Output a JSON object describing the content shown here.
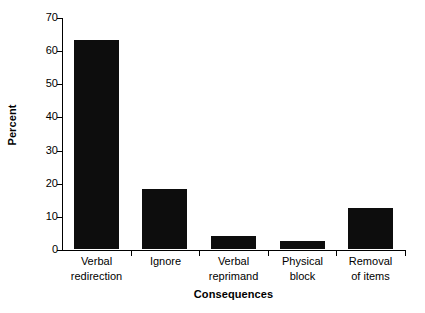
{
  "chart_data": {
    "type": "bar",
    "title": "",
    "subtitle": "",
    "xlabel": "Consequences",
    "ylabel": "Percent",
    "categories": [
      "Verbal\nredirection",
      "Ignore",
      "Verbal\nreprimand",
      "Physical\nblock",
      "Removal\nof items"
    ],
    "values": [
      63,
      18,
      4,
      2.3,
      12.3
    ],
    "ylim": [
      0,
      70
    ],
    "yticks": [
      0,
      10,
      20,
      30,
      40,
      50,
      60,
      70
    ],
    "ytick_labels": [
      "0",
      "10",
      "20",
      "30",
      "40",
      "50",
      "60",
      "70"
    ],
    "grid": false,
    "legend": null,
    "bar_color": "#0d0d0d",
    "axis_color": "#000000",
    "background_color": "#ffffff"
  },
  "axes": {
    "y_title": "Percent",
    "x_title": "Consequences"
  }
}
